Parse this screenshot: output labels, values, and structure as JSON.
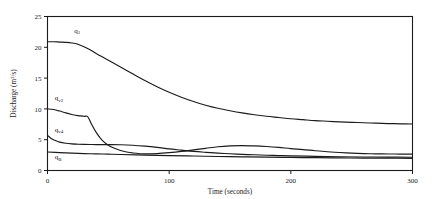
{
  "chart_data": {
    "type": "line",
    "title": "",
    "xlabel": "Time (seconds)",
    "ylabel": "Discharge (m^3/s)",
    "ylabel_main": "Discharge (m",
    "ylabel_exp": "3",
    "ylabel_tail": "/s)",
    "xlim": [
      0,
      300
    ],
    "ylim": [
      0,
      25
    ],
    "xticks": [
      0,
      100,
      200,
      300
    ],
    "yticks": [
      0,
      5,
      10,
      15,
      20,
      25
    ],
    "xtick_labels": [
      "0",
      "100",
      "200",
      "300"
    ],
    "ytick_labels": [
      "0",
      "5",
      "10",
      "15",
      "20",
      "25"
    ],
    "grid": false,
    "legend": "inline-annotations",
    "line_color": "#1b1b1b",
    "series": [
      {
        "name": "q1",
        "label_base": "q",
        "label_sub": "1",
        "label_x": 22,
        "label_y": 22.4,
        "x": [
          0,
          5,
          10,
          15,
          20,
          25,
          30,
          35,
          40,
          50,
          60,
          70,
          80,
          90,
          100,
          110,
          120,
          130,
          140,
          150,
          160,
          170,
          180,
          190,
          200,
          210,
          220,
          230,
          240,
          250,
          260,
          270,
          280,
          290,
          300
        ],
        "values": [
          20.9,
          20.9,
          20.85,
          20.8,
          20.7,
          20.5,
          20.1,
          19.6,
          19.0,
          17.9,
          16.8,
          15.7,
          14.6,
          13.6,
          12.7,
          11.9,
          11.2,
          10.6,
          10.1,
          9.7,
          9.35,
          9.05,
          8.8,
          8.6,
          8.4,
          8.25,
          8.1,
          8.0,
          7.9,
          7.82,
          7.75,
          7.68,
          7.62,
          7.58,
          7.55
        ]
      },
      {
        "name": "qv2",
        "label_base": "q",
        "label_sub": "v2",
        "label_x": 6,
        "label_y": 11.4,
        "x": [
          0,
          5,
          10,
          15,
          20,
          25,
          30,
          33,
          36,
          40,
          45,
          50,
          55,
          60,
          65,
          70,
          80,
          90,
          100,
          110,
          120,
          130,
          140,
          150,
          160,
          170,
          180,
          190,
          200,
          210,
          220,
          230,
          240,
          250,
          260,
          270,
          280,
          290,
          300
        ],
        "values": [
          10.0,
          9.9,
          9.65,
          9.35,
          9.1,
          8.9,
          8.8,
          8.75,
          7.6,
          6.2,
          4.9,
          4.1,
          3.6,
          3.25,
          3.0,
          2.85,
          2.7,
          2.75,
          2.9,
          3.1,
          3.35,
          3.6,
          3.85,
          4.0,
          4.05,
          4.0,
          3.9,
          3.75,
          3.55,
          3.4,
          3.2,
          3.05,
          2.92,
          2.82,
          2.75,
          2.7,
          2.68,
          2.67,
          2.66
        ]
      },
      {
        "name": "qv4",
        "label_base": "q",
        "label_sub": "v4",
        "label_x": 6,
        "label_y": 6.3,
        "x": [
          0,
          3,
          6,
          10,
          15,
          20,
          25,
          30,
          35,
          40,
          50,
          60,
          70,
          80,
          90,
          100,
          110,
          120,
          130,
          140,
          150,
          160,
          170,
          180,
          190,
          200,
          220,
          240,
          260,
          280,
          300
        ],
        "values": [
          5.7,
          5.2,
          4.9,
          4.6,
          4.42,
          4.32,
          4.27,
          4.24,
          4.22,
          4.21,
          4.2,
          4.18,
          4.1,
          3.95,
          3.75,
          3.5,
          3.3,
          3.1,
          2.95,
          2.82,
          2.72,
          2.62,
          2.55,
          2.48,
          2.42,
          2.38,
          2.3,
          2.24,
          2.2,
          2.17,
          2.15
        ]
      },
      {
        "name": "qB",
        "label_base": "q",
        "label_sub": "B",
        "label_x": 6,
        "label_y": 1.9,
        "x": [
          0,
          10,
          20,
          30,
          40,
          50,
          60,
          80,
          100,
          120,
          140,
          160,
          180,
          200,
          220,
          240,
          260,
          280,
          300
        ],
        "values": [
          3.0,
          2.9,
          2.82,
          2.75,
          2.7,
          2.65,
          2.6,
          2.5,
          2.42,
          2.35,
          2.28,
          2.22,
          2.16,
          2.12,
          2.08,
          2.05,
          2.02,
          2.0,
          1.98
        ]
      }
    ]
  }
}
